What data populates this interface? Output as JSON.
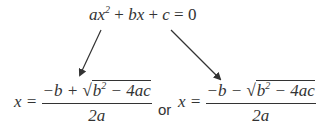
{
  "equation": {
    "text": "ax² + bx + c = 0",
    "a": "a",
    "x": "x",
    "exp": "2",
    "plus1": " + ",
    "b": "b",
    "x2": "x",
    "plus2": " + ",
    "c": "c",
    "eq": " = ",
    "zero": "0"
  },
  "solution_plus": {
    "lhs": "x = ",
    "numerator_pre": "−b + ",
    "radical": "√",
    "radicand_b": "b",
    "radicand_exp": "2",
    "radicand_rest": " − 4ac",
    "denominator": "2a"
  },
  "connector": "or",
  "solution_minus": {
    "lhs": "x = ",
    "numerator_pre": "−b − ",
    "radical": "√",
    "radicand_b": "b",
    "radicand_exp": "2",
    "radicand_rest": " − 4ac",
    "denominator": "2a"
  },
  "arrows": [
    {
      "from": [
        101,
        30
      ],
      "to": [
        79,
        77
      ]
    },
    {
      "from": [
        171,
        30
      ],
      "to": [
        222,
        81
      ]
    }
  ],
  "colors": {
    "ink": "#333333"
  }
}
